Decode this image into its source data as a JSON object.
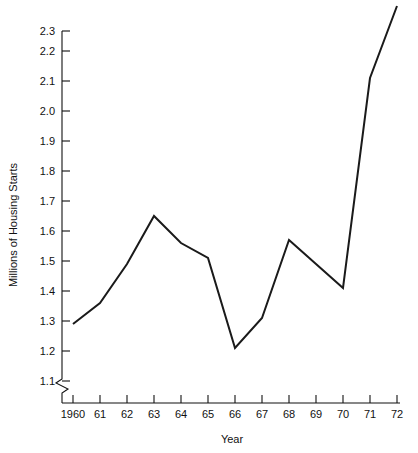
{
  "chart_data": {
    "type": "line",
    "title": "",
    "xlabel": "Year",
    "ylabel": "Millions of Housing Starts",
    "categories": [
      "1960",
      "61",
      "62",
      "63",
      "64",
      "65",
      "66",
      "67",
      "68",
      "69",
      "70",
      "71",
      "72"
    ],
    "x": [
      1960,
      1961,
      1962,
      1963,
      1964,
      1965,
      1966,
      1967,
      1968,
      1969,
      1970,
      1971,
      1972
    ],
    "values": [
      1.29,
      1.36,
      1.49,
      1.65,
      1.56,
      1.51,
      1.21,
      1.31,
      1.57,
      1.49,
      1.41,
      2.11,
      2.35
    ],
    "series": [
      {
        "name": "Housing Starts",
        "values": [
          1.29,
          1.36,
          1.49,
          1.65,
          1.56,
          1.51,
          1.21,
          1.31,
          1.57,
          1.49,
          1.41,
          2.11,
          2.35
        ]
      }
    ],
    "ylim": [
      1.05,
      2.36
    ],
    "xlim": [
      1959.6,
      1972.2
    ],
    "ytick_labels": [
      "1.1",
      "1.2",
      "1.3",
      "1.4",
      "1.5",
      "1.6",
      "1.7",
      "1.8",
      "1.9",
      "2.0",
      "2.1",
      "2.2",
      "2.3"
    ],
    "ytick_values": [
      1.1,
      1.2,
      1.3,
      1.4,
      1.5,
      1.6,
      1.7,
      1.8,
      1.9,
      2.0,
      2.1,
      2.2,
      2.3
    ],
    "grid": false,
    "legend": false,
    "legend_position": "none",
    "axis_break_y": true,
    "line_color": "#1a1a1a",
    "axis_color": "#111111",
    "background": "#ffffff"
  }
}
